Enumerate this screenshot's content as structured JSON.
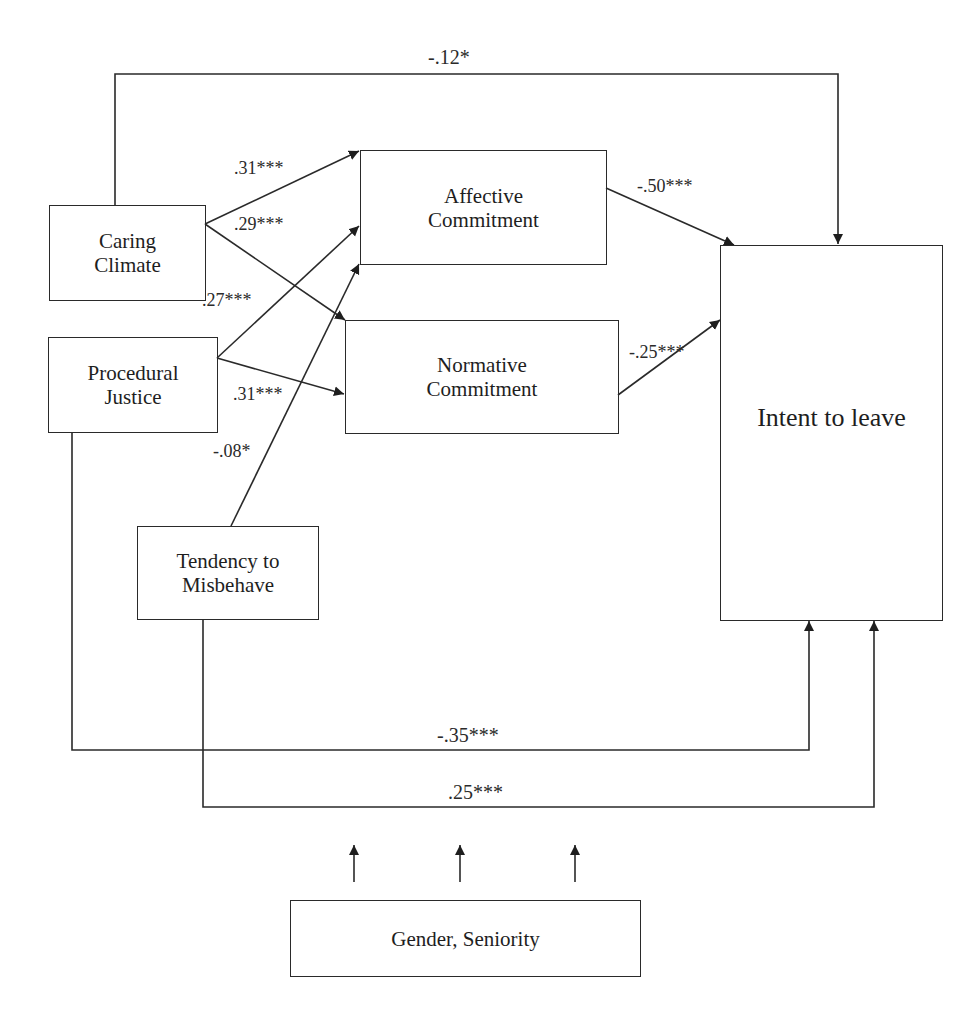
{
  "nodes": {
    "caring_climate": {
      "line1": "Caring",
      "line2": "Climate"
    },
    "procedural_justice": {
      "line1": "Procedural",
      "line2": "Justice"
    },
    "tendency_to_misbehave": {
      "line1": "Tendency to",
      "line2": "Misbehave"
    },
    "affective_commitment": {
      "line1": "Affective",
      "line2": "Commitment"
    },
    "normative_commitment": {
      "line1": "Normative",
      "line2": "Commitment"
    },
    "intent_to_leave": {
      "label": "Intent to leave"
    },
    "controls": {
      "label": "Gender, Seniority"
    }
  },
  "edges": {
    "caring_to_intent": "-.12*",
    "caring_to_affective": ".31***",
    "caring_to_normative": ".29***",
    "procedural_to_affective": ".27***",
    "procedural_to_normative": ".31***",
    "misbehave_to_affective": "-.08*",
    "affective_to_intent": "-.50***",
    "normative_to_intent": "-.25***",
    "procedural_to_intent": "-.35***",
    "misbehave_to_intent": ".25***"
  }
}
